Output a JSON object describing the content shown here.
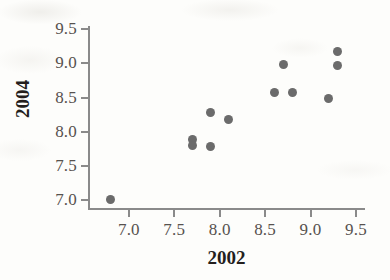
{
  "chart_data": {
    "type": "scatter",
    "title": "",
    "xlabel": "2002",
    "ylabel": "2004",
    "xlim": [
      6.55,
      9.6
    ],
    "ylim": [
      6.85,
      9.55
    ],
    "xticks": [
      "7.0",
      "7.5",
      "8.0",
      "8.5",
      "9.0",
      "9.5"
    ],
    "xtick_values": [
      7.0,
      7.5,
      8.0,
      8.5,
      9.0,
      9.5
    ],
    "yticks": [
      "7.0",
      "7.5",
      "8.0",
      "8.5",
      "9.0",
      "9.5"
    ],
    "ytick_values": [
      7.0,
      7.5,
      8.0,
      8.5,
      9.0,
      9.5
    ],
    "grid": false,
    "legend": false,
    "marker_color": "#6b6b6b",
    "axis_color": "#8a8a8a",
    "points": [
      {
        "x": 6.8,
        "y": 7.0
      },
      {
        "x": 7.7,
        "y": 7.88
      },
      {
        "x": 7.7,
        "y": 7.8
      },
      {
        "x": 7.9,
        "y": 8.28
      },
      {
        "x": 7.9,
        "y": 7.78
      },
      {
        "x": 8.1,
        "y": 8.18
      },
      {
        "x": 8.6,
        "y": 8.57
      },
      {
        "x": 8.7,
        "y": 8.98
      },
      {
        "x": 8.8,
        "y": 8.57
      },
      {
        "x": 9.2,
        "y": 8.48
      },
      {
        "x": 9.3,
        "y": 9.18
      },
      {
        "x": 9.3,
        "y": 8.97
      }
    ]
  }
}
